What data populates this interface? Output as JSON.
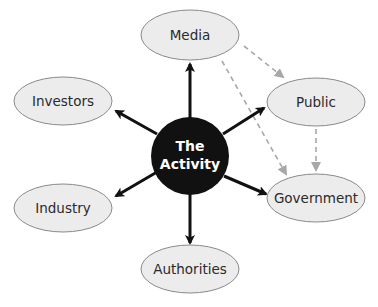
{
  "diagram": {
    "center": {
      "label_line1": "The",
      "label_line2": "Activity",
      "fill": "#111111",
      "text_color": "#ffffff"
    },
    "nodes": [
      {
        "id": "media",
        "label": "Media"
      },
      {
        "id": "investors",
        "label": "Investors"
      },
      {
        "id": "public",
        "label": "Public"
      },
      {
        "id": "industry",
        "label": "Industry"
      },
      {
        "id": "government",
        "label": "Government"
      },
      {
        "id": "authorities",
        "label": "Authorities"
      }
    ],
    "edges_solid": [
      {
        "from": "The Activity",
        "to": "Media"
      },
      {
        "from": "The Activity",
        "to": "Investors"
      },
      {
        "from": "The Activity",
        "to": "Public"
      },
      {
        "from": "The Activity",
        "to": "Industry"
      },
      {
        "from": "The Activity",
        "to": "Government"
      },
      {
        "from": "The Activity",
        "to": "Authorities"
      }
    ],
    "edges_dashed": [
      {
        "from": "Media",
        "to": "Public"
      },
      {
        "from": "Media",
        "to": "Government"
      },
      {
        "from": "Public",
        "to": "Government"
      }
    ],
    "colors": {
      "node_fill": "#ececec",
      "node_stroke": "#8a8a8a",
      "solid_arrow": "#111111",
      "dashed_arrow": "#a8a8a8"
    }
  }
}
